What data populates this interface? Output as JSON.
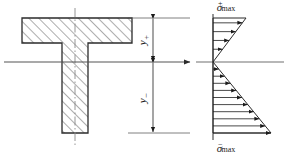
{
  "figure": {
    "type": "engineering-diagram",
    "line_color": "#2b2b2b",
    "hatch_color": "#4a4a4a",
    "axis_color": "#555555",
    "center_line_color": "#8a8a8a"
  },
  "section": {
    "name": "t-beam-cross-section",
    "flange": {
      "x": 22,
      "y": 18,
      "width": 110,
      "height": 25
    },
    "web": {
      "x": 62,
      "y": 43,
      "width": 26,
      "height": 90
    },
    "hatch_label": "diagonal-section-hatch",
    "center_line_label": "vertical-centerline"
  },
  "neutral_axis": {
    "name": "neutral-axis",
    "y": 62,
    "x_start": 4,
    "x_end": 190,
    "arrow": "right-arrowhead"
  },
  "dimensions": [
    {
      "id": "y-plus",
      "symbol": "y",
      "sign": "+",
      "label": "y₊",
      "x": 153,
      "y_top": 18,
      "y_bottom": 62,
      "text_x": 146,
      "text_y": 40
    },
    {
      "id": "y-minus",
      "symbol": "y",
      "sign": "−",
      "label": "y₋",
      "x": 153,
      "y_top": 62,
      "y_bottom": 133,
      "text_x": 146,
      "text_y": 98
    }
  ],
  "extension_lines": [
    {
      "id": "ext-top",
      "x_start": 128,
      "x_end": 190,
      "y": 18
    },
    {
      "id": "ext-middle",
      "x_start": 128,
      "x_end": 190,
      "y": 62
    },
    {
      "id": "ext-bottom",
      "x_start": 128,
      "x_end": 190,
      "y": 133
    }
  ],
  "stress_diagram": {
    "name": "bending-stress-distribution",
    "baseline_x": 213,
    "top_y": 18,
    "neutral_y": 62,
    "bottom_y": 133,
    "tension_label": {
      "text": "σ",
      "sup": "+",
      "sub": "max",
      "x": 226,
      "y": 11
    },
    "compression_label": {
      "text": "σ",
      "sup": "−",
      "sub": "max",
      "x": 226,
      "y": 152
    },
    "tension_peak_x": 246,
    "compression_peak_x": 271,
    "tension_arrow_count": 5,
    "compression_arrow_count": 10,
    "vertical_axis": {
      "x": 213,
      "y_top": 14,
      "y_bottom": 140
    },
    "horizontal_axis": {
      "x_start": 196,
      "x_end": 284,
      "y": 62
    }
  }
}
